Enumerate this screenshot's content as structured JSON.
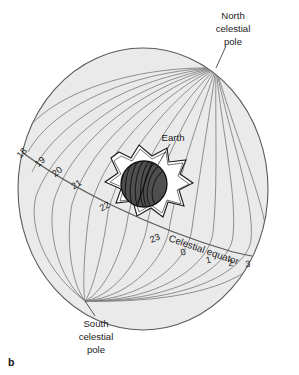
{
  "figure": {
    "panel_letter": "b",
    "title_alt": "Celestial sphere with right ascension hour circles",
    "background_color": "#ffffff"
  },
  "sphere": {
    "name": "celestial-sphere",
    "fill_color": "#eaeaea",
    "outline_color": "#5a5a5a",
    "meridian_color": "#7d7d7d",
    "center_x": 143,
    "center_y": 189,
    "radius_x": 125,
    "radius_y": 141
  },
  "labels": {
    "north_pole": {
      "lines": [
        "North",
        "celestial",
        "pole"
      ],
      "x": 233,
      "y": 18
    },
    "south_pole": {
      "lines": [
        "South",
        "celestial",
        "pole"
      ],
      "x": 96,
      "y": 322
    },
    "earth": {
      "text": "Earth",
      "x": 173,
      "y": 138
    },
    "celestial_equator": {
      "text": "Celestial equator",
      "x": 168,
      "y": 241
    }
  },
  "hour_marks": {
    "name": "right-ascension-hours",
    "items": [
      {
        "label": "18",
        "x": 24,
        "y": 155,
        "rotate": -47
      },
      {
        "label": "19",
        "x": 42,
        "y": 164,
        "rotate": -42
      },
      {
        "label": "20",
        "x": 59,
        "y": 174,
        "rotate": -38
      },
      {
        "label": "21",
        "x": 78,
        "y": 187,
        "rotate": -33
      },
      {
        "label": "22",
        "x": 106,
        "y": 209,
        "rotate": -28
      },
      {
        "label": "23",
        "x": 156,
        "y": 241,
        "rotate": -22
      },
      {
        "label": "0",
        "y": 255,
        "x": 184,
        "rotate": -16
      },
      {
        "label": "1",
        "x": 209,
        "y": 263,
        "rotate": -12
      },
      {
        "label": "2",
        "x": 231,
        "y": 266,
        "rotate": -8
      },
      {
        "label": "3",
        "x": 248,
        "y": 267,
        "rotate": -5
      }
    ]
  },
  "earth_globe": {
    "name": "earth-globe",
    "fill_color": "#4a4a4a",
    "stripe_color": "#1f1f1f",
    "center_x": 144,
    "center_y": 184,
    "radius": 23
  },
  "starburst": {
    "name": "earth-starburst",
    "fill_color": "#ffffff",
    "outline_color": "#1a1a1a",
    "points": 8
  }
}
